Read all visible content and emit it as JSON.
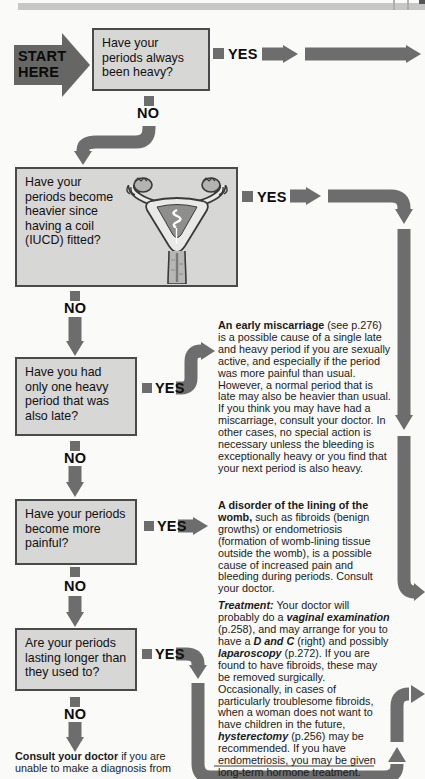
{
  "page": {
    "background": "#fafaf8",
    "top_bar_color": "#c7c7c5"
  },
  "colors": {
    "arrow_gray": "#6d6d6d",
    "box_fill": "#d7d7d5",
    "box_border": "#4a4a4a"
  },
  "labels": {
    "start": "START\nHERE",
    "yes": "YES",
    "no": "NO"
  },
  "questions": [
    {
      "text": "Have your periods always been heavy?"
    },
    {
      "text": "Have your periods become heavier since having a coil (IUCD) fitted?"
    },
    {
      "text": "Have you had only one heavy period that was also late?"
    },
    {
      "text": "Have your periods become more painful?"
    },
    {
      "text": "Are your periods lasting longer than they used to?"
    }
  ],
  "info_miscarriage": {
    "lead": "An early miscarriage",
    "body": " (see p.276) is a possible cause of a single late and heavy period if you are sexually active, and especially if the period was more painful than usual. However, a normal period that is late may also be heavier than usual. If you think you may have had a miscarriage, consult your doctor. In other cases, no special action is necessary unless the bleeding is exceptionally heavy or you find that your next period is also heavy."
  },
  "info_womb": {
    "lead": "A disorder of the lining of the womb,",
    "body": " such as fibroids (benign growths) or endometriosis (formation of womb-lining tissue outside the womb), is a possible cause of increased pain and bleeding during periods. Consult your doctor."
  },
  "treatment": {
    "s1": "Treatment:",
    "s2": " Your doctor will probably do a ",
    "s3": "vaginal examination",
    "s4": " (p.258), and may arrange for you to have a ",
    "s5": "D and C",
    "s6": " (right) and possibly ",
    "s7": "laparoscopy",
    "s8": " (p.272). If you are found to have fibroids, these may be removed surgically. Occasionally, in cases of particularly troublesome fibroids, when a woman does not want to have children in the future, ",
    "s9": "hysterectomy",
    "s10": " (p.256) may be recommended. If you have endometriosis, you may be given long-term hormone treatment."
  },
  "footer": {
    "lead": "Consult your doctor",
    "body": " if you are unable to make a diagnosis from"
  }
}
